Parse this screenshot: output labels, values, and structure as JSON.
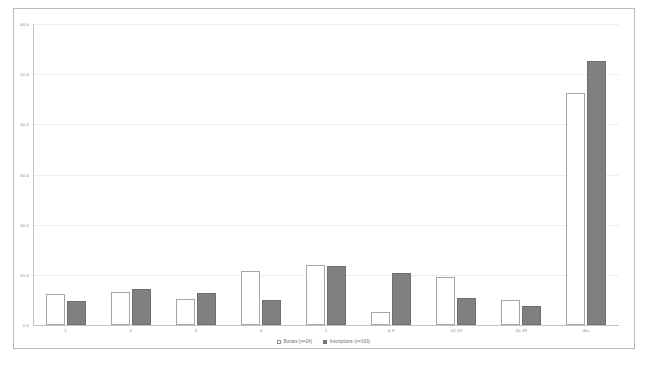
{
  "chart_data": {
    "type": "bar",
    "title": "",
    "subtitle": "",
    "xlabel": "",
    "ylabel": "",
    "categories": [
      "1",
      "2",
      "3",
      "4",
      "5",
      "6-9",
      "10-19",
      "20-39",
      "40+"
    ],
    "series": [
      {
        "name": "Burials (n=24)",
        "legend_label": "Burials (n=24)",
        "color": "#ffffff",
        "border_color": "#a6a6a6",
        "values": [
          6.2,
          6.6,
          5.2,
          10.7,
          11.9,
          2.6,
          9.5,
          5.0,
          46.2
        ]
      },
      {
        "name": "Inscriptions (n=163)",
        "legend_label": "Inscriptions (n=163)",
        "color": "#808080",
        "border_color": "#6e6e6e",
        "values": [
          4.8,
          7.2,
          6.4,
          5.0,
          11.7,
          10.3,
          5.4,
          3.8,
          52.6
        ]
      }
    ],
    "ylim": [
      0,
      60
    ],
    "yticks": [
      0,
      10,
      20,
      30,
      40,
      50,
      60
    ],
    "ytick_labels": [
      "0.0",
      "10.0",
      "20.0",
      "30.0",
      "40.0",
      "50.0",
      "60.0"
    ],
    "grid": true,
    "grid_axis": "y",
    "legend_position": "bottom"
  },
  "legend": {
    "items": [
      {
        "label": "Burials (n=24)"
      },
      {
        "label": "Inscriptions (n=163)"
      }
    ]
  }
}
